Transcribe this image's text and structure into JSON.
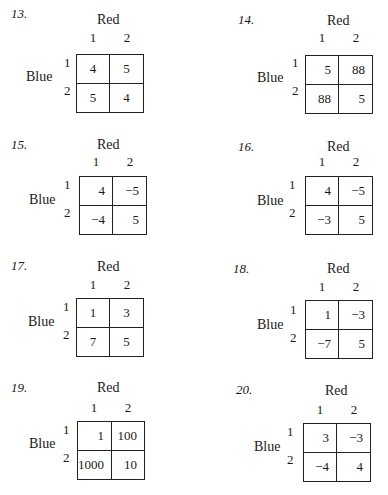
{
  "page": {
    "column_player": "Red",
    "row_player": "Blue",
    "problems": [
      {
        "number": "13.",
        "col_labels": [
          "1",
          "2"
        ],
        "row_labels": [
          "1",
          "2"
        ],
        "payoffs": [
          [
            "4",
            "5"
          ],
          [
            "5",
            "4"
          ]
        ]
      },
      {
        "number": "14.",
        "col_labels": [
          "1",
          "2"
        ],
        "row_labels": [
          "1",
          "2"
        ],
        "payoffs": [
          [
            "5",
            "88"
          ],
          [
            "88",
            "5"
          ]
        ]
      },
      {
        "number": "15.",
        "col_labels": [
          "1",
          "2"
        ],
        "row_labels": [
          "1",
          "2"
        ],
        "payoffs": [
          [
            "4",
            "−5"
          ],
          [
            "−4",
            "5"
          ]
        ]
      },
      {
        "number": "16.",
        "col_labels": [
          "1",
          "2"
        ],
        "row_labels": [
          "1",
          "2"
        ],
        "payoffs": [
          [
            "4",
            "−5"
          ],
          [
            "−3",
            "5"
          ]
        ]
      },
      {
        "number": "17.",
        "col_labels": [
          "1",
          "2"
        ],
        "row_labels": [
          "1",
          "2"
        ],
        "payoffs": [
          [
            "1",
            "3"
          ],
          [
            "7",
            "5"
          ]
        ]
      },
      {
        "number": "18.",
        "col_labels": [
          "1",
          "2"
        ],
        "row_labels": [
          "1",
          "2"
        ],
        "payoffs": [
          [
            "1",
            "−3"
          ],
          [
            "−7",
            "5"
          ]
        ]
      },
      {
        "number": "19.",
        "col_labels": [
          "1",
          "2"
        ],
        "row_labels": [
          "1",
          "2"
        ],
        "payoffs": [
          [
            "1",
            "100"
          ],
          [
            "1000",
            "10"
          ]
        ]
      },
      {
        "number": "20.",
        "col_labels": [
          "1",
          "2"
        ],
        "row_labels": [
          "1",
          "2"
        ],
        "payoffs": [
          [
            "3",
            "−3"
          ],
          [
            "−4",
            "4"
          ]
        ]
      }
    ]
  }
}
